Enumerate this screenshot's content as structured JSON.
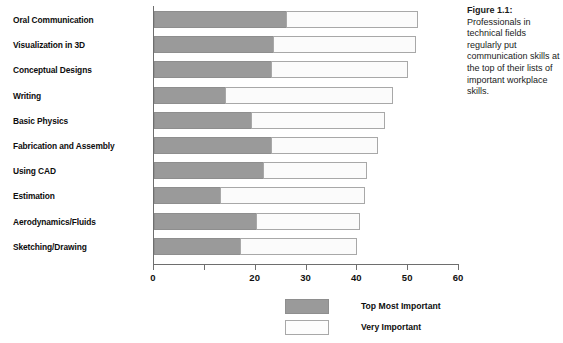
{
  "caption": {
    "title": "Figure 1.1:",
    "body": "Professionals in technical fields regularly put communication skills at the top of their lists of important workplace skills."
  },
  "legend": {
    "entries": [
      {
        "label": "Top Most Important",
        "swatch": "primary",
        "color": "#9a9a9a"
      },
      {
        "label": "Very Important",
        "swatch": "secondary",
        "color": "#fdfdfd"
      }
    ]
  },
  "chart_data": {
    "type": "bar",
    "orientation": "horizontal",
    "stacked": true,
    "title": "",
    "xlabel": "",
    "ylabel": "",
    "xlim": [
      0,
      60
    ],
    "grid": false,
    "legend_position": "bottom-center",
    "tick_values": [
      0,
      10,
      20,
      30,
      40,
      50,
      60
    ],
    "tick_labels": [
      "0",
      "",
      "20",
      "30",
      "40",
      "50",
      "60"
    ],
    "categories": [
      "Oral Communication",
      "Visualization in 3D",
      "Conceptual Designs",
      "Writing",
      "Basic Physics",
      "Fabrication and Assembly",
      "Using CAD",
      "Estimation",
      "Aerodynamics/Fluids",
      "Sketching/Drawing"
    ],
    "series": [
      {
        "name": "Top Most Important",
        "color": "#9a9a9a",
        "values": [
          26,
          23.5,
          23,
          14,
          19,
          23,
          21.5,
          13,
          20,
          17
        ]
      },
      {
        "name": "Very Important",
        "color": "#fdfdfd",
        "values": [
          26,
          28,
          27,
          33,
          26.5,
          21,
          20.5,
          28.5,
          20.5,
          23
        ]
      }
    ],
    "totals": [
      52,
      51.5,
      50,
      47,
      45.5,
      44,
      42,
      41.5,
      40.5,
      40
    ]
  }
}
